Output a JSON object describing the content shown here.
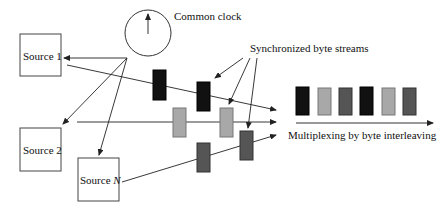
{
  "diagram": {
    "clock_label": "Common clock",
    "streams_label": "Synchronized byte streams",
    "mux_label": "Multiplexing by byte interleaving",
    "sources": [
      {
        "label": "Source 1"
      },
      {
        "label": "Source 2"
      },
      {
        "label_prefix": "Source ",
        "label_var": "N"
      }
    ],
    "colors": {
      "stream1": "#111111",
      "stream2": "#a8a8a8",
      "streamN": "#555555",
      "line": "#222222"
    },
    "output_sequence": [
      "stream1",
      "stream2",
      "streamN",
      "stream1",
      "stream2",
      "streamN"
    ]
  }
}
